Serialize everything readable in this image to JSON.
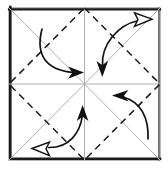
{
  "figure": {
    "title": "Square fold pattern with rotational fold arrows",
    "type": "origami-crease-diagram",
    "canvas": {
      "width": 168,
      "height": 169,
      "background": "#ffffff"
    }
  },
  "colors": {
    "background": "#ffffff",
    "border_dark": "#1a1a1a",
    "border_light": "#8c8c8c",
    "crease_gray": "#b0b0b0",
    "dashed_fold": "#1a1a1a",
    "arrow_stroke": "#111111",
    "arrowhead_open_fill": "#ffffff"
  },
  "sheet": {
    "label": "paper-square",
    "left": 9,
    "top": 8,
    "right": 160,
    "bottom": 160,
    "border_width": 2.6,
    "border_width_light": 1.2
  },
  "crease_lines": [
    {
      "name": "diagonal-tl-br",
      "x1": 9,
      "y1": 8,
      "x2": 160,
      "y2": 160,
      "style": "solid",
      "color": "#b0b0b0",
      "width": 1
    },
    {
      "name": "diagonal-tr-bl",
      "x1": 160,
      "y1": 8,
      "x2": 9,
      "y2": 160,
      "style": "solid",
      "color": "#b0b0b0",
      "width": 1
    },
    {
      "name": "median-horizontal",
      "x1": 9,
      "y1": 84,
      "x2": 160,
      "y2": 84,
      "style": "solid",
      "color": "#b0b0b0",
      "width": 1
    },
    {
      "name": "median-vertical",
      "x1": 84.5,
      "y1": 8,
      "x2": 84.5,
      "y2": 160,
      "style": "solid",
      "color": "#b0b0b0",
      "width": 1
    }
  ],
  "dashed_diamond": {
    "name": "valley-fold-diamond",
    "points": "84.5,8 160,84 84.5,160 9,84",
    "dash_pattern": "7 5",
    "color": "#1a1a1a",
    "width": 1.5
  },
  "arrows": [
    {
      "name": "fold-arrow-top-left",
      "quadrant": "top-left",
      "path": "M 42 29 C 36 55, 48 70, 74 72",
      "head_type": "filled",
      "head_direction": "right",
      "head_points": "84,72.5 69,67 72,72.5 69,78"
    },
    {
      "name": "fold-arrow-top-right",
      "quadrant": "top-right",
      "path": "M 103 58 C 110 36, 124 24, 139 21",
      "head_type": "open",
      "head_direction": "up-right",
      "head_points": "151,20 135,13.5 137.5,20.5 135,27"
    },
    {
      "name": "fold-arrow-top-right-tail",
      "quadrant": "top-right",
      "path": "M 103 58 C 103 58, 103 58, 103 58",
      "head_type": "filled",
      "head_direction": "down",
      "head_points": "102.5,68 97,53 102.5,56.5 108,53"
    },
    {
      "name": "fold-arrow-bottom-right",
      "quadrant": "bottom-right",
      "path": "M 148 138 C 148 118, 139 104, 123 99",
      "head_type": "filled",
      "head_direction": "left",
      "head_points": "111,97 126,91.5 123,97 126,102.5"
    },
    {
      "name": "fold-arrow-bottom-left",
      "quadrant": "bottom-left",
      "path": "M 50 147 C 70 147, 80 134, 82 117",
      "head_type": "filled",
      "head_direction": "up",
      "head_points": "82.5,106 88,121 82.5,117.5 77,121"
    },
    {
      "name": "fold-arrow-bottom-left-tail",
      "quadrant": "bottom-left",
      "path": "M 50 147 C 50 147, 50 147, 50 147",
      "head_type": "open",
      "head_direction": "left",
      "head_points": "33,148 49,141.5 46.5,148 49,154.5"
    }
  ]
}
